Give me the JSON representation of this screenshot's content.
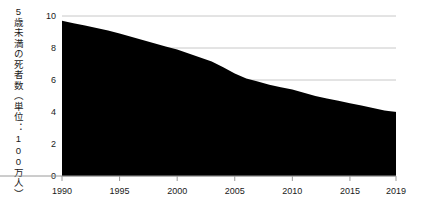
{
  "chart_data": {
    "type": "area",
    "title": "",
    "subtitle": "",
    "xlabel": "",
    "ylabel": "5歳未満の死者数（単位：100万人）",
    "xlim": [
      1990,
      2019
    ],
    "ylim": [
      0,
      10
    ],
    "grid": true,
    "legend": null,
    "area_color": "#000000",
    "gridline_color": "#c8c8c8",
    "axis_color": "#9a9a9a",
    "x_tick_labels": [
      "1990",
      "1995",
      "2000",
      "2005",
      "2010",
      "2015",
      "2019"
    ],
    "x_tick_values": [
      1990,
      1995,
      2000,
      2005,
      2010,
      2015,
      2019
    ],
    "y_tick_labels": [
      "0",
      "2",
      "4",
      "6",
      "8",
      "10"
    ],
    "y_tick_values": [
      0,
      2,
      4,
      6,
      8,
      10
    ],
    "x": [
      1990,
      1991,
      1992,
      1993,
      1994,
      1995,
      1996,
      1997,
      1998,
      1999,
      2000,
      2001,
      2002,
      2003,
      2004,
      2005,
      2006,
      2007,
      2008,
      2009,
      2010,
      2011,
      2012,
      2013,
      2014,
      2015,
      2016,
      2017,
      2018,
      2019
    ],
    "values": [
      9.7,
      9.55,
      9.4,
      9.25,
      9.1,
      8.9,
      8.7,
      8.5,
      8.3,
      8.1,
      7.9,
      7.65,
      7.4,
      7.15,
      6.8,
      6.4,
      6.1,
      5.9,
      5.7,
      5.55,
      5.4,
      5.2,
      5.0,
      4.85,
      4.7,
      4.55,
      4.4,
      4.25,
      4.1,
      4.0
    ],
    "series": [
      {
        "name": "5歳未満の死者数",
        "values": [
          9.7,
          9.55,
          9.4,
          9.25,
          9.1,
          8.9,
          8.7,
          8.5,
          8.3,
          8.1,
          7.9,
          7.65,
          7.4,
          7.15,
          6.8,
          6.4,
          6.1,
          5.9,
          5.7,
          5.55,
          5.4,
          5.2,
          5.0,
          4.85,
          4.7,
          4.55,
          4.4,
          4.25,
          4.1,
          4.0
        ]
      }
    ]
  }
}
